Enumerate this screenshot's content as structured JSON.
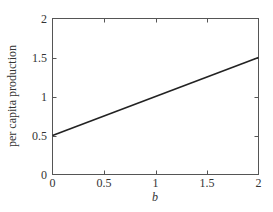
{
  "chart_data": {
    "type": "line",
    "title": "",
    "xlabel": "b",
    "ylabel": "per capita production",
    "xlim": [
      0,
      2
    ],
    "ylim": [
      0,
      2
    ],
    "grid": false,
    "legend": null,
    "x_ticks": [
      0,
      0.5,
      1,
      1.5,
      2
    ],
    "x_tick_labels": [
      "0",
      "0.5",
      "1",
      "1.5",
      "2"
    ],
    "y_ticks": [
      0,
      0.5,
      1,
      1.5,
      2
    ],
    "y_tick_labels": [
      "0",
      "0.5",
      "1",
      "1.5",
      "2"
    ],
    "series": [
      {
        "name": "per capita production",
        "x": [
          0,
          2
        ],
        "y": [
          0.5,
          1.5
        ],
        "color": "#222222"
      }
    ]
  },
  "style": {
    "axis_color": "#555555",
    "line_color": "#222222",
    "background": "#ffffff"
  }
}
